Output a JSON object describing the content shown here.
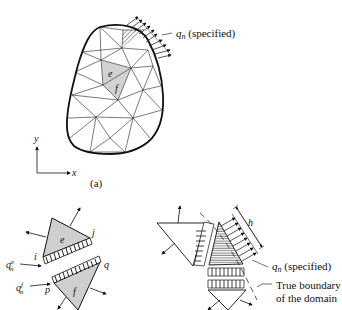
{
  "figure_a": {
    "caption": "(a)",
    "flux_label": "q",
    "flux_sub": "n",
    "flux_suffix": " (specified)",
    "element_e": "e",
    "element_f": "f",
    "axis_x": "x",
    "axis_y": "y"
  },
  "figure_b": {
    "element_e": "e",
    "element_f": "f",
    "node_i": "i",
    "node_j": "j",
    "node_p": "p",
    "node_q": "q",
    "flux_e_label": "q",
    "flux_e_sub": "n",
    "flux_e_sup": "e",
    "flux_f_label": "q",
    "flux_f_sub": "n",
    "flux_f_sup": "f"
  },
  "figure_c": {
    "height_label": "h",
    "flux_label": "q",
    "flux_sub": "n",
    "flux_suffix": " (specified)",
    "boundary_line1": "True boundary",
    "boundary_line2": "of the domain"
  },
  "colors": {
    "ink": "#111111",
    "shade": "#cfcfcf"
  }
}
